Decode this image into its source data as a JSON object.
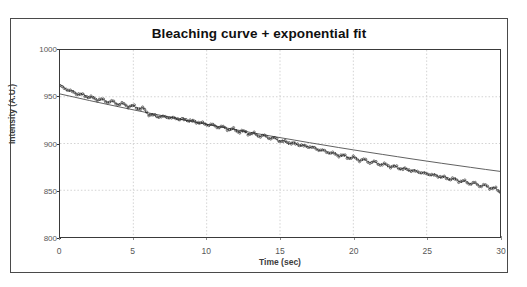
{
  "page": {
    "cutoff_text": "Fig. Photobleaching measurement",
    "background_color": "#ffffff"
  },
  "figure": {
    "border_color": "#4a4a4a",
    "title": "Bleaching curve + exponential fit"
  },
  "axes": {
    "y_label": "Intensity (A.U.)",
    "x_label": "Time (sec)",
    "y_ticks": [
      "800",
      "850",
      "900",
      "950",
      "1000"
    ],
    "x_ticks": [
      "0",
      "5",
      "10",
      "15",
      "20",
      "25",
      "30"
    ],
    "frame_color": "#3a3a3a",
    "grid_color": "#c8c8c8"
  },
  "chart_data": {
    "type": "line",
    "title": "Bleaching curve + exponential fit",
    "xlabel": "Time (sec)",
    "ylabel": "Intensity (A.U.)",
    "xlim": [
      0,
      30
    ],
    "ylim": [
      800,
      1000
    ],
    "xticks": [
      0,
      5,
      10,
      15,
      20,
      25,
      30
    ],
    "yticks": [
      800,
      850,
      900,
      950,
      1000
    ],
    "grid": true,
    "legend": "none",
    "marker": "open-circle",
    "marker_color": "#2a2a2a",
    "fit_color": "#4d4d4d",
    "series": [
      {
        "name": "Measured intensity",
        "style": "markers",
        "x": [
          0.0,
          0.3,
          0.6,
          0.9,
          1.2,
          1.5,
          1.8,
          2.1,
          2.4,
          2.7,
          3.0,
          3.3,
          3.6,
          3.9,
          4.2,
          4.5,
          4.8,
          5.1,
          5.4,
          5.7,
          6.0,
          6.3,
          6.6,
          6.9,
          7.2,
          7.5,
          7.8,
          8.1,
          8.4,
          8.7,
          9.0,
          9.3,
          9.6,
          9.9,
          10.2,
          10.5,
          10.8,
          11.1,
          11.4,
          11.7,
          12.0,
          12.3,
          12.6,
          12.9,
          13.2,
          13.5,
          13.8,
          14.1,
          14.4,
          14.7,
          15.0,
          15.3,
          15.6,
          15.9,
          16.2,
          16.5,
          16.8,
          17.1,
          17.4,
          17.7,
          18.0,
          18.3,
          18.6,
          18.9,
          19.2,
          19.5,
          19.8,
          20.1,
          20.4,
          20.7,
          21.0,
          21.3,
          21.6,
          21.9,
          22.2,
          22.5,
          22.8,
          23.1,
          23.4,
          23.7,
          24.0,
          24.3,
          24.6,
          24.9,
          25.2,
          25.5,
          25.8,
          26.1,
          26.4,
          26.7,
          27.0,
          27.3,
          27.6,
          27.9,
          28.2,
          28.5,
          28.8,
          29.1,
          29.4,
          29.7,
          30.0
        ],
        "y": [
          962,
          959,
          957,
          955,
          953,
          952,
          951,
          949,
          948,
          947,
          946,
          945,
          944,
          943,
          942,
          941,
          940,
          939,
          938,
          937,
          932,
          930,
          929,
          929,
          928,
          928,
          927,
          926,
          926,
          925,
          924,
          923,
          922,
          921,
          920,
          919,
          918,
          917,
          916,
          915,
          914,
          913,
          912,
          911,
          910,
          909,
          908,
          907,
          906,
          905,
          903,
          902,
          901,
          900,
          899,
          898,
          897,
          896,
          895,
          893,
          892,
          891,
          889,
          888,
          887,
          886,
          885,
          884,
          883,
          882,
          881,
          880,
          879,
          878,
          877,
          876,
          875,
          874,
          873,
          872,
          871,
          870,
          869,
          868,
          867,
          866,
          865,
          864,
          863,
          862,
          861,
          860,
          859,
          858,
          857,
          856,
          855,
          854,
          853,
          851,
          849
        ]
      },
      {
        "name": "Exponential fit",
        "style": "line",
        "x": [
          0,
          1,
          2,
          3,
          4,
          5,
          6,
          7,
          8,
          9,
          10,
          11,
          12,
          13,
          14,
          15,
          16,
          17,
          18,
          19,
          20,
          21,
          22,
          23,
          24,
          25,
          26,
          27,
          28,
          29,
          30
        ],
        "y": [
          953.0,
          949.5,
          946.0,
          942.6,
          939.3,
          936.0,
          932.8,
          929.7,
          926.6,
          923.5,
          920.5,
          917.6,
          914.7,
          911.8,
          909.0,
          906.3,
          903.6,
          900.9,
          898.3,
          895.7,
          893.2,
          890.7,
          888.3,
          885.9,
          883.5,
          881.2,
          878.9,
          876.7,
          874.5,
          872.3,
          870.2
        ]
      }
    ]
  }
}
